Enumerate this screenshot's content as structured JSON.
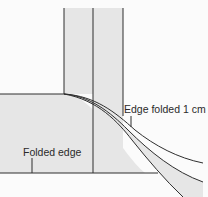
{
  "diagram": {
    "labels": {
      "edge_folded": "Edge folded 1 cm",
      "folded_edge": "Folded edge"
    },
    "colors": {
      "background": "#fbfbfb",
      "fill": "#e6e6e6",
      "line": "#2e2e2e"
    }
  }
}
